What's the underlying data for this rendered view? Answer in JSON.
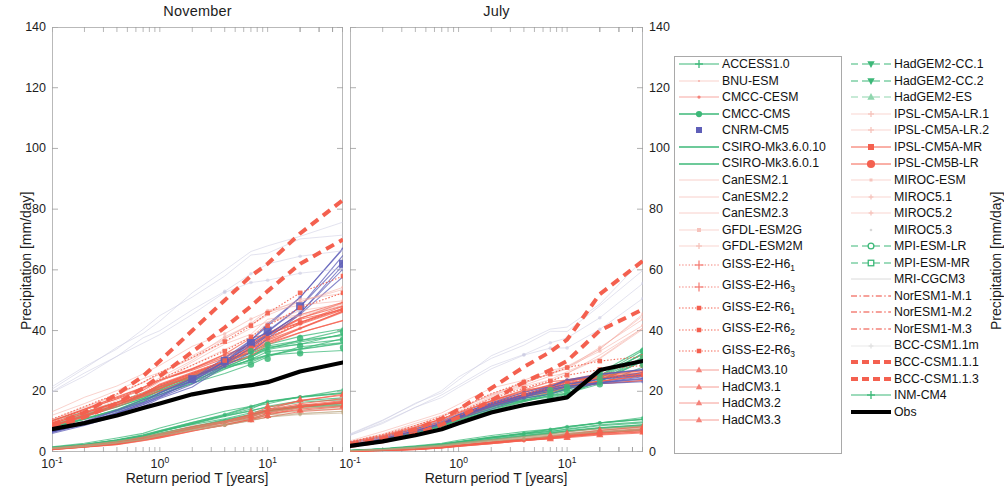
{
  "figure": {
    "xlabel": "Return period T [years]",
    "ylabel_left": "Precipitation [mm/day]",
    "ylabel_right": "Precipitation [mm/day]"
  },
  "panels": [
    {
      "id": "november",
      "title": "November"
    },
    {
      "id": "july",
      "title": "July"
    }
  ],
  "colors": {
    "green": "#3cb878",
    "red": "#f4604f",
    "red_bold": "#f4604f",
    "blue": "#5e5eb8",
    "black": "#000000",
    "pale_red": "#f4a9a0",
    "pale_green": "#a9ddc0",
    "grid": "#bdbdbd",
    "axis": "#b9b9b9"
  },
  "legend": {
    "left_column": [
      {
        "label": "ACCESS1.0",
        "color": "#3cb878",
        "style": "solid",
        "marker": "plus",
        "weight": 1.2,
        "size": 4
      },
      {
        "label": "BNU-ESM",
        "color": "#f6bdb6",
        "style": "solid",
        "marker": "square",
        "weight": 0.7,
        "size": 2
      },
      {
        "label": "CMCC-CESM",
        "color": "#f4837a",
        "style": "solid",
        "marker": "circle",
        "weight": 0.7,
        "size": 2.6
      },
      {
        "label": "CMCC-CMS",
        "color": "#3cb878",
        "style": "solid",
        "marker": "circle",
        "weight": 1.6,
        "size": 5
      },
      {
        "label": "CNRM-CM5",
        "color": "#5e5eb8",
        "style": "none",
        "marker": "square",
        "weight": 0,
        "size": 6
      },
      {
        "label": "CSIRO-Mk3.6.0.10",
        "color": "#3cb878",
        "style": "solid",
        "marker": "star",
        "weight": 1.3,
        "size": 7
      },
      {
        "label": "CSIRO-Mk3.6.0.1",
        "color": "#3cb878",
        "style": "solid",
        "marker": "star",
        "weight": 1.3,
        "size": 7
      },
      {
        "label": "CanESM2.1",
        "color": "#f6c3bc",
        "style": "solid",
        "marker": "none",
        "weight": 0.8,
        "size": 0
      },
      {
        "label": "CanESM2.2",
        "color": "#f6c3bc",
        "style": "solid",
        "marker": "none",
        "weight": 0.8,
        "size": 0
      },
      {
        "label": "CanESM2.3",
        "color": "#f6c3bc",
        "style": "solid",
        "marker": "none",
        "weight": 0.8,
        "size": 0
      },
      {
        "label": "GFDL-ESM2G",
        "color": "#f6c3bc",
        "style": "solid",
        "marker": "square",
        "weight": 0.7,
        "size": 4
      },
      {
        "label": "GFDL-ESM2M",
        "color": "#f6c3bc",
        "style": "solid",
        "marker": "plus",
        "weight": 0.7,
        "size": 3
      },
      {
        "label": "GISS-E2-H6",
        "sub": "1",
        "color": "#f4837a",
        "style": "dotted",
        "marker": "plus",
        "weight": 1.1,
        "size": 4.5
      },
      {
        "label": "GISS-E2-H6",
        "sub": "3",
        "color": "#f4837a",
        "style": "dotted",
        "marker": "plus",
        "weight": 1.1,
        "size": 4.5
      },
      {
        "label": "GISS-E2-R6",
        "sub": "1",
        "color": "#f4604f",
        "style": "dotted",
        "marker": "square",
        "weight": 1.1,
        "size": 4.5
      },
      {
        "label": "GISS-E2-R6",
        "sub": "2",
        "color": "#f4604f",
        "style": "dotted",
        "marker": "square",
        "weight": 1.1,
        "size": 4.5
      },
      {
        "label": "GISS-E2-R6",
        "sub": "3",
        "color": "#f4604f",
        "style": "dotted",
        "marker": "square",
        "weight": 1.1,
        "size": 4.5
      },
      {
        "label": "HadCM3.10",
        "color": "#f4837a",
        "style": "solid",
        "marker": "triangle",
        "weight": 0.8,
        "size": 6
      },
      {
        "label": "HadCM3.1",
        "color": "#f4837a",
        "style": "solid",
        "marker": "triangle",
        "weight": 0.8,
        "size": 6
      },
      {
        "label": "HadCM3.2",
        "color": "#f4837a",
        "style": "solid",
        "marker": "triangle",
        "weight": 0.8,
        "size": 6
      },
      {
        "label": "HadCM3.3",
        "color": "#f4837a",
        "style": "solid",
        "marker": "triangle",
        "weight": 0.8,
        "size": 6
      }
    ],
    "right_column": [
      {
        "label": "HadGEM2-CC.1",
        "color": "#3cb878",
        "style": "dashed",
        "marker": "triangle-down",
        "weight": 1.2,
        "size": 7
      },
      {
        "label": "HadGEM2-CC.2",
        "color": "#3cb878",
        "style": "dashed",
        "marker": "triangle-down",
        "weight": 1.2,
        "size": 7
      },
      {
        "label": "HadGEM2-ES",
        "color": "#8fd6ae",
        "style": "dashed",
        "marker": "triangle",
        "weight": 1.2,
        "size": 7
      },
      {
        "label": "IPSL-CM5A-LR.1",
        "color": "#f6c3bc",
        "style": "solid",
        "marker": "plus",
        "weight": 0.7,
        "size": 3
      },
      {
        "label": "IPSL-CM5A-LR.2",
        "color": "#f6c3bc",
        "style": "solid",
        "marker": "plus",
        "weight": 0.7,
        "size": 3
      },
      {
        "label": "IPSL-CM5A-MR",
        "color": "#f4604f",
        "style": "solid",
        "marker": "square",
        "weight": 1.0,
        "size": 6
      },
      {
        "label": "IPSL-CM5B-LR",
        "color": "#f4604f",
        "style": "solid",
        "marker": "circle",
        "weight": 1.0,
        "size": 6.5
      },
      {
        "label": "MIROC-ESM",
        "color": "#f6c3bc",
        "style": "solid",
        "marker": "square",
        "weight": 0.7,
        "size": 3
      },
      {
        "label": "MIROC5.1",
        "color": "#f6c3bc",
        "style": "solid",
        "marker": "plus",
        "weight": 0.7,
        "size": 2.4
      },
      {
        "label": "MIROC5.2",
        "color": "#f6c3bc",
        "style": "solid",
        "marker": "plus",
        "weight": 0.7,
        "size": 2.4
      },
      {
        "label": "MIROC5.3",
        "color": "#d8d8d8",
        "style": "none",
        "marker": "dot",
        "weight": 0,
        "size": 2
      },
      {
        "label": "MPI-ESM-LR",
        "color": "#3cb878",
        "style": "dashed",
        "marker": "circle-open",
        "weight": 1.1,
        "size": 5.5
      },
      {
        "label": "MPI-ESM-MR",
        "color": "#3cb878",
        "style": "dashed",
        "marker": "square-open",
        "weight": 1.1,
        "size": 5.5
      },
      {
        "label": "MRI-CGCM3",
        "color": "#d0d0d0",
        "style": "solid",
        "marker": "none",
        "weight": 0.8,
        "size": 0
      },
      {
        "label": "NorESM1-M.1",
        "color": "#f4837a",
        "style": "dashdot",
        "marker": "none",
        "weight": 1.4,
        "size": 0
      },
      {
        "label": "NorESM1-M.2",
        "color": "#f4837a",
        "style": "dashdot",
        "marker": "none",
        "weight": 1.4,
        "size": 0
      },
      {
        "label": "NorESM1-M.3",
        "color": "#f4837a",
        "style": "dashdot",
        "marker": "none",
        "weight": 1.4,
        "size": 0
      },
      {
        "label": "BCC-CSM1.1m",
        "color": "#e0e0e0",
        "style": "solid",
        "marker": "plus",
        "weight": 0.7,
        "size": 2.4
      },
      {
        "label": "BCC-CSM1.1.1",
        "color": "#f4604f",
        "style": "dashed",
        "marker": "none",
        "weight": 4.0,
        "size": 0
      },
      {
        "label": "BCC-CSM1.1.3",
        "color": "#f4604f",
        "style": "dashed",
        "marker": "none",
        "weight": 4.0,
        "size": 0
      },
      {
        "label": "INM-CM4",
        "color": "#3cb878",
        "style": "solid",
        "marker": "plus",
        "weight": 1.1,
        "size": 4
      },
      {
        "label": "Obs",
        "color": "#000000",
        "style": "solid",
        "marker": "none",
        "weight": 4.2,
        "size": 0
      }
    ]
  },
  "chart_data": {
    "type": "line",
    "xlabel": "Return period T [years]",
    "ylabel": "Precipitation [mm/day]",
    "xscale": "log",
    "xlim": [
      0.1,
      50
    ],
    "ylim": [
      0,
      140
    ],
    "yticks": [
      0,
      20,
      40,
      60,
      80,
      100,
      120,
      140
    ],
    "xticks": [
      0.1,
      1,
      10
    ],
    "xtick_labels": [
      "10^-1",
      "10^0",
      "10^1"
    ],
    "grid": false,
    "legend_position": "right-outside",
    "panels": [
      {
        "name": "November",
        "x": [
          0.1,
          0.2,
          0.4,
          0.7,
          1.0,
          2.0,
          4.0,
          7.0,
          10.0,
          20.0,
          50.0
        ],
        "series": [
          {
            "name": "Obs",
            "color": "#000000",
            "values": [
              7.5,
              9.5,
              12.0,
              14.5,
              16.0,
              19.0,
              21.0,
              22.0,
              23.0,
              26.5,
              29.5
            ]
          },
          {
            "name": "BCC-CSM1.1.1",
            "color": "#f4604f",
            "values": [
              9.0,
              13.0,
              19.0,
              25.0,
              30.0,
              40.0,
              50.0,
              58.0,
              62.0,
              72.0,
              83.0
            ]
          },
          {
            "name": "BCC-CSM1.1.3",
            "color": "#f4604f",
            "values": [
              8.0,
              11.5,
              16.0,
              21.0,
              25.0,
              33.0,
              41.0,
              48.0,
              53.0,
              62.0,
              70.0
            ]
          },
          {
            "name": "CNRM-CM5",
            "color": "#5e5eb8",
            "values": [
              7.0,
              10.0,
              13.5,
              16.5,
              19.0,
              24.0,
              30.0,
              36.0,
              40.0,
              48.0,
              62.0
            ]
          },
          {
            "name": "ensemble-green-upper",
            "color": "#3cb878",
            "values": [
              9.0,
              12.0,
              15.0,
              18.0,
              20.0,
              24.0,
              28.0,
              31.0,
              33.0,
              35.0,
              37.0
            ]
          },
          {
            "name": "ensemble-red-upper",
            "color": "#f4604f",
            "values": [
              9.5,
              13.0,
              16.5,
              19.5,
              22.0,
              26.0,
              30.0,
              34.0,
              37.0,
              42.0,
              46.0
            ]
          },
          {
            "name": "ensemble-green-lower",
            "color": "#3cb878",
            "values": [
              1.5,
              2.5,
              4.0,
              5.5,
              7.0,
              9.5,
              12.0,
              14.0,
              15.5,
              17.0,
              18.0
            ]
          },
          {
            "name": "ensemble-red-lower",
            "color": "#f4604f",
            "values": [
              1.0,
              2.0,
              3.0,
              4.5,
              5.5,
              8.0,
              10.0,
              12.0,
              13.5,
              15.5,
              17.0
            ]
          }
        ]
      },
      {
        "name": "July",
        "x": [
          0.1,
          0.2,
          0.4,
          0.7,
          1.0,
          2.0,
          4.0,
          7.0,
          10.0,
          20.0,
          50.0
        ],
        "series": [
          {
            "name": "Obs",
            "color": "#000000",
            "values": [
              2.0,
              3.5,
              5.5,
              7.5,
              9.5,
              13.0,
              15.5,
              17.0,
              18.0,
              27.0,
              30.0
            ]
          },
          {
            "name": "BCC-CSM1.1.1",
            "color": "#f4604f",
            "values": [
              2.5,
              4.5,
              7.5,
              11.0,
              14.0,
              21.0,
              28.0,
              33.0,
              37.0,
              52.0,
              63.0
            ]
          },
          {
            "name": "BCC-CSM1.1.3",
            "color": "#f4604f",
            "values": [
              2.0,
              3.5,
              6.0,
              9.0,
              11.5,
              17.0,
              23.0,
              27.0,
              30.0,
              40.0,
              47.0
            ]
          },
          {
            "name": "ensemble-blue-upper",
            "color": "#5e5eb8",
            "values": [
              3.0,
              5.0,
              7.5,
              10.0,
              12.0,
              16.0,
              19.0,
              21.0,
              22.5,
              24.0,
              25.0
            ]
          },
          {
            "name": "ensemble-green-upper",
            "color": "#3cb878",
            "values": [
              2.5,
              4.5,
              7.0,
              9.0,
              11.0,
              14.5,
              17.0,
              19.0,
              20.0,
              24.0,
              31.0
            ]
          },
          {
            "name": "ensemble-red-lower",
            "color": "#f4604f",
            "values": [
              0.3,
              0.6,
              1.0,
              1.6,
              2.2,
              3.2,
              4.2,
              5.0,
              5.5,
              6.5,
              7.5
            ]
          },
          {
            "name": "ensemble-green-lower",
            "color": "#3cb878",
            "values": [
              0.5,
              1.0,
              1.8,
              2.6,
              3.4,
              4.8,
              6.0,
              7.0,
              7.8,
              9.0,
              10.0
            ]
          }
        ]
      }
    ]
  }
}
